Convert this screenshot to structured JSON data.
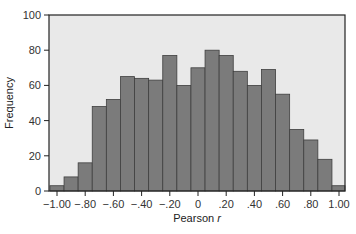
{
  "chart_data": {
    "type": "bar",
    "title": "",
    "xlabel": "Pearson r",
    "xlabel_main": "Pearson ",
    "xlabel_italic": "r",
    "ylabel": "Frequency",
    "ylim": [
      0,
      100
    ],
    "xlim": [
      -1.05,
      1.05
    ],
    "grid": false,
    "legend": null,
    "bin_width": 0.1,
    "categories": [
      -1.0,
      -0.9,
      -0.8,
      -0.7,
      -0.6,
      -0.5,
      -0.4,
      -0.3,
      -0.2,
      -0.1,
      0.0,
      0.1,
      0.2,
      0.3,
      0.4,
      0.5,
      0.6,
      0.7,
      0.8,
      0.9,
      1.0
    ],
    "values": [
      3,
      8,
      16,
      48,
      52,
      65,
      64,
      63,
      77,
      60,
      70,
      80,
      77,
      68,
      60,
      69,
      55,
      35,
      29,
      18,
      3
    ],
    "y_ticks": [
      0,
      20,
      40,
      60,
      80,
      100
    ],
    "y_tick_labels": [
      "0",
      "20",
      "40",
      "60",
      "80",
      "100"
    ],
    "x_ticks": [
      -1.0,
      -0.8,
      -0.6,
      -0.4,
      -0.2,
      0,
      0.2,
      0.4,
      0.6,
      0.8,
      1.0
    ],
    "x_tick_labels": [
      "−1.00",
      "−.80",
      "−.60",
      "−.40",
      "−.20",
      "0",
      ".20",
      ".40",
      ".60",
      ".80",
      "1.00"
    ],
    "colors": {
      "plot_background": "#e9e9e9",
      "bar_fill": "#7b7b7b",
      "bar_stroke": "#3f3f3f",
      "axis": "#222222"
    }
  }
}
